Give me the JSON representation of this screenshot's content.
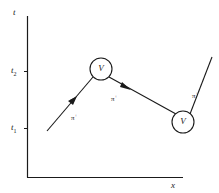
{
  "diagram": {
    "axes": {
      "y_label": "t",
      "x_label": "x",
      "y_ticks": [
        {
          "base": "t",
          "sub": "2"
        },
        {
          "base": "t",
          "sub": "1"
        }
      ]
    },
    "vertices": [
      {
        "label": "V"
      },
      {
        "label": "V"
      }
    ],
    "propagators": [
      {
        "label": "π",
        "charge": "+"
      },
      {
        "label": "π",
        "charge": "+"
      },
      {
        "label": "π",
        "charge": "+"
      }
    ],
    "colors": {
      "line": "#1a1a1a",
      "background": "#ffffff"
    }
  }
}
